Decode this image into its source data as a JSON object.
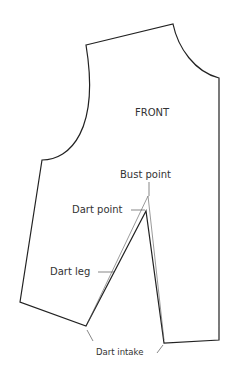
{
  "diagram": {
    "title": "FRONT",
    "labels": {
      "bust_point": "Bust point",
      "dart_point": "Dart point",
      "dart_leg": "Dart leg",
      "dart_intake": "Dart intake"
    },
    "colors": {
      "outline": "#222222",
      "leader": "#555555",
      "text": "#333333",
      "background": "#ffffff"
    }
  }
}
